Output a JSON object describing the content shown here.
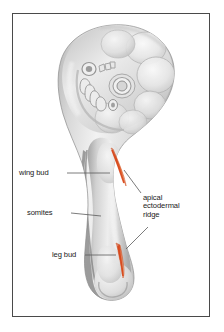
{
  "figure": {
    "frame_color": "#4a4a4a",
    "background_color": "#ffffff"
  },
  "labels": {
    "wing_bud": "wing bud",
    "somites": "somites",
    "leg_bud": "leg bud",
    "apical_ectodermal_ridge": "apical\nectodermal\nridge",
    "apical_ectodermal_ridge_line1": "apical",
    "apical_ectodermal_ridge_line2": "ectodermal",
    "apical_ectodermal_ridge_line3": "ridge"
  },
  "colors": {
    "ridge_highlight": "#d94a1e",
    "ridge_highlight_light": "#e8773f",
    "embryo_light": "#f2f2f2",
    "embryo_mid": "#c9c9c9",
    "embryo_dark": "#8f8f8f",
    "outline": "#6e6e6e",
    "leader_line": "#5a5a5a",
    "text": "#1a1a1a"
  },
  "annotations": [
    {
      "name": "wing-bud",
      "text": "wing bud"
    },
    {
      "name": "somites",
      "text": "somites"
    },
    {
      "name": "leg-bud",
      "text": "leg bud"
    },
    {
      "name": "apical-ectodermal-ridge",
      "text": "apical ectodermal ridge"
    }
  ]
}
